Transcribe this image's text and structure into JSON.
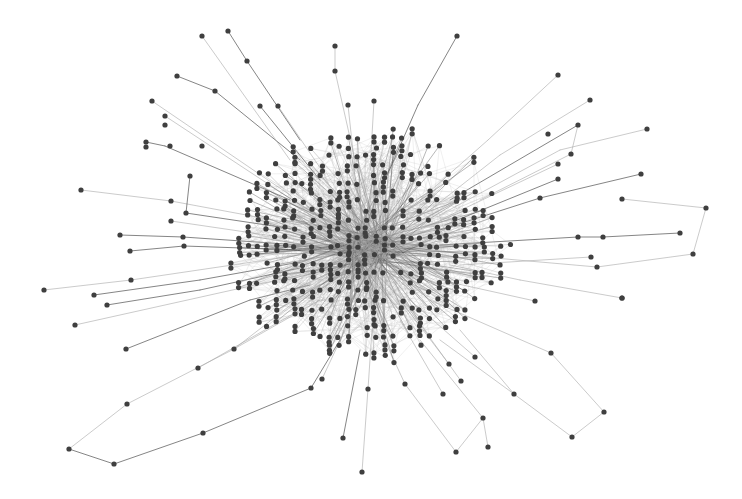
{
  "canvas": {
    "width": 742,
    "height": 499,
    "background": "#ffffff"
  },
  "style": {
    "node_color": "#3f3f3f",
    "node_radius": 2.6,
    "edge_color_dark": "#4a4a4a",
    "edge_color_light": "#a8a8a8",
    "edge_width": 0.8
  },
  "core": {
    "center": [
      372,
      245
    ],
    "radius_x": 150,
    "radius_y": 125,
    "grid_step": 9,
    "fill_probability": 0.62,
    "seed": 17,
    "hub": [
      370,
      250
    ]
  },
  "outer_nodes": [
    [
      202,
      36
    ],
    [
      228,
      31
    ],
    [
      247,
      61
    ],
    [
      177,
      76
    ],
    [
      215,
      91
    ],
    [
      152,
      101
    ],
    [
      260,
      106
    ],
    [
      278,
      106
    ],
    [
      165,
      116
    ],
    [
      165,
      125
    ],
    [
      146,
      142
    ],
    [
      146,
      147
    ],
    [
      170,
      146
    ],
    [
      202,
      146
    ],
    [
      335,
      46
    ],
    [
      335,
      71
    ],
    [
      348,
      105
    ],
    [
      374,
      101
    ],
    [
      457,
      36
    ],
    [
      558,
      75
    ],
    [
      590,
      100
    ],
    [
      578,
      125
    ],
    [
      548,
      134
    ],
    [
      571,
      154
    ],
    [
      647,
      129
    ],
    [
      558,
      164
    ],
    [
      641,
      174
    ],
    [
      558,
      179
    ],
    [
      540,
      198
    ],
    [
      622,
      199
    ],
    [
      706,
      208
    ],
    [
      680,
      233
    ],
    [
      603,
      237
    ],
    [
      578,
      237
    ],
    [
      693,
      254
    ],
    [
      597,
      267
    ],
    [
      591,
      257
    ],
    [
      622,
      298
    ],
    [
      81,
      190
    ],
    [
      190,
      176
    ],
    [
      171,
      201
    ],
    [
      186,
      213
    ],
    [
      171,
      221
    ],
    [
      120,
      235
    ],
    [
      183,
      237
    ],
    [
      130,
      251
    ],
    [
      184,
      246
    ],
    [
      44,
      290
    ],
    [
      131,
      280
    ],
    [
      94,
      295
    ],
    [
      107,
      305
    ],
    [
      75,
      325
    ],
    [
      126,
      349
    ],
    [
      234,
      349
    ],
    [
      198,
      368
    ],
    [
      127,
      404
    ],
    [
      69,
      449
    ],
    [
      114,
      464
    ],
    [
      203,
      433
    ],
    [
      311,
      388
    ],
    [
      322,
      379
    ],
    [
      343,
      438
    ],
    [
      362,
      472
    ],
    [
      368,
      389
    ],
    [
      456,
      452
    ],
    [
      488,
      447
    ],
    [
      483,
      418
    ],
    [
      572,
      437
    ],
    [
      604,
      412
    ],
    [
      514,
      394
    ],
    [
      551,
      353
    ],
    [
      622,
      298
    ],
    [
      535,
      301
    ],
    [
      405,
      384
    ],
    [
      443,
      394
    ],
    [
      461,
      381
    ],
    [
      475,
      357
    ],
    [
      449,
      364
    ]
  ],
  "outer_edges": [
    [
      [
        228,
        31
      ],
      [
        247,
        61
      ],
      [
        300,
        140
      ],
      "dark"
    ],
    [
      [
        177,
        76
      ],
      [
        215,
        91
      ],
      [
        300,
        160
      ],
      "dark"
    ],
    [
      [
        202,
        36
      ],
      [
        290,
        160
      ],
      "light"
    ],
    [
      [
        335,
        46
      ],
      [
        335,
        71
      ],
      [
        355,
        160
      ],
      "light"
    ],
    [
      [
        457,
        36
      ],
      [
        418,
        105
      ],
      [
        385,
        180
      ],
      "dark"
    ],
    [
      [
        558,
        75
      ],
      [
        488,
        140
      ],
      [
        420,
        200
      ],
      "light"
    ],
    [
      [
        590,
        100
      ],
      [
        500,
        155
      ],
      [
        430,
        210
      ],
      "light"
    ],
    [
      [
        578,
        125
      ],
      [
        571,
        154
      ],
      [
        480,
        200
      ],
      "light"
    ],
    [
      [
        578,
        125
      ],
      [
        450,
        200
      ],
      "dark"
    ],
    [
      [
        647,
        129
      ],
      [
        560,
        150
      ],
      [
        440,
        215
      ],
      "light"
    ],
    [
      [
        641,
        174
      ],
      [
        540,
        198
      ],
      [
        440,
        230
      ],
      "dark"
    ],
    [
      [
        622,
        199
      ],
      [
        706,
        208
      ],
      [
        693,
        254
      ],
      [
        597,
        267
      ],
      [
        460,
        255
      ],
      "light"
    ],
    [
      [
        680,
        233
      ],
      [
        603,
        237
      ],
      [
        578,
        237
      ],
      [
        440,
        245
      ],
      "dark"
    ],
    [
      [
        591,
        257
      ],
      [
        460,
        265
      ],
      "light"
    ],
    [
      [
        622,
        298
      ],
      [
        520,
        280
      ],
      [
        450,
        265
      ],
      "light"
    ],
    [
      [
        146,
        142
      ],
      [
        165,
        146
      ],
      [
        290,
        200
      ],
      "dark"
    ],
    [
      [
        152,
        101
      ],
      [
        290,
        195
      ],
      "light"
    ],
    [
      [
        165,
        116
      ],
      [
        300,
        205
      ],
      "light"
    ],
    [
      [
        81,
        190
      ],
      [
        171,
        201
      ],
      [
        300,
        225
      ],
      "light"
    ],
    [
      [
        190,
        176
      ],
      [
        186,
        213
      ],
      [
        300,
        230
      ],
      "dark"
    ],
    [
      [
        120,
        235
      ],
      [
        183,
        237
      ],
      [
        300,
        245
      ],
      "dark"
    ],
    [
      [
        130,
        251
      ],
      [
        184,
        246
      ],
      [
        300,
        250
      ],
      "dark"
    ],
    [
      [
        44,
        290
      ],
      [
        131,
        280
      ],
      [
        300,
        255
      ],
      "light"
    ],
    [
      [
        94,
        295
      ],
      [
        200,
        280
      ],
      [
        300,
        262
      ],
      "dark"
    ],
    [
      [
        107,
        305
      ],
      [
        200,
        290
      ],
      [
        300,
        268
      ],
      "dark"
    ],
    [
      [
        75,
        325
      ],
      [
        300,
        275
      ],
      "light"
    ],
    [
      [
        126,
        349
      ],
      [
        250,
        300
      ],
      [
        310,
        285
      ],
      "dark"
    ],
    [
      [
        127,
        404
      ],
      [
        234,
        349
      ],
      [
        320,
        300
      ],
      "light"
    ],
    [
      [
        69,
        449
      ],
      [
        114,
        464
      ],
      [
        203,
        433
      ],
      [
        311,
        388
      ],
      [
        340,
        340
      ],
      "dark"
    ],
    [
      [
        69,
        449
      ],
      [
        127,
        404
      ],
      "light"
    ],
    [
      [
        198,
        368
      ],
      [
        300,
        310
      ],
      "light"
    ],
    [
      [
        343,
        438
      ],
      [
        360,
        350
      ],
      "dark"
    ],
    [
      [
        362,
        472
      ],
      [
        368,
        389
      ],
      [
        372,
        330
      ],
      "light"
    ],
    [
      [
        456,
        452
      ],
      [
        405,
        384
      ],
      [
        380,
        330
      ],
      "light"
    ],
    [
      [
        488,
        447
      ],
      [
        483,
        418
      ],
      [
        420,
        340
      ],
      "light"
    ],
    [
      [
        456,
        452
      ],
      [
        483,
        418
      ],
      "light"
    ],
    [
      [
        572,
        437
      ],
      [
        604,
        412
      ],
      [
        551,
        353
      ],
      [
        430,
        300
      ],
      "light"
    ],
    [
      [
        572,
        437
      ],
      [
        514,
        394
      ],
      [
        440,
        340
      ],
      "light"
    ],
    [
      [
        535,
        301
      ],
      [
        440,
        280
      ],
      "light"
    ],
    [
      [
        475,
        357
      ],
      [
        410,
        300
      ],
      "light"
    ],
    [
      [
        461,
        381
      ],
      [
        410,
        310
      ],
      "light"
    ],
    [
      [
        449,
        364
      ],
      [
        400,
        300
      ],
      "light"
    ],
    [
      [
        443,
        394
      ],
      [
        400,
        320
      ],
      "light"
    ],
    [
      [
        260,
        106
      ],
      [
        320,
        180
      ],
      "dark"
    ],
    [
      [
        278,
        106
      ],
      [
        325,
        175
      ],
      "light"
    ],
    [
      [
        374,
        101
      ],
      [
        370,
        170
      ],
      "light"
    ],
    [
      [
        348,
        105
      ],
      [
        355,
        170
      ],
      "light"
    ],
    [
      [
        558,
        164
      ],
      [
        440,
        220
      ],
      "light"
    ],
    [
      [
        558,
        179
      ],
      [
        445,
        225
      ],
      "dark"
    ],
    [
      [
        171,
        221
      ],
      [
        300,
        240
      ],
      "light"
    ],
    [
      [
        234,
        349
      ],
      [
        310,
        290
      ],
      "light"
    ],
    [
      [
        322,
        379
      ],
      [
        345,
        330
      ],
      "light"
    ],
    [
      [
        514,
        394
      ],
      [
        460,
        330
      ],
      "light"
    ]
  ]
}
